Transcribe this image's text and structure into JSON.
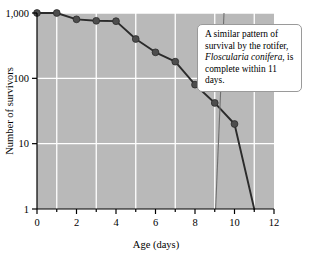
{
  "chart_data": {
    "type": "line",
    "title": "",
    "xlabel": "Age (days)",
    "ylabel": "Number of survivors",
    "yscale": "log",
    "xlim": [
      0,
      12
    ],
    "ylim": [
      1,
      1000
    ],
    "grid": true,
    "grid_color": "#ffffff",
    "plot_bgcolor": "#b9b9b9",
    "line_color": "#2b2b2b",
    "marker_color": "#4d4d4d",
    "legend": "none",
    "xticks": [
      0,
      2,
      4,
      6,
      8,
      10,
      12
    ],
    "xtick_labels": [
      "0",
      "2",
      "4",
      "6",
      "8",
      "10",
      "12"
    ],
    "xminor_ticks": [
      1,
      3,
      5,
      7,
      9,
      11
    ],
    "yticks": [
      1,
      10,
      100,
      1000
    ],
    "ytick_labels": [
      "1",
      "10",
      "100",
      "1,000"
    ],
    "series": [
      {
        "name": "survivors",
        "x": [
          0,
          1,
          2,
          3,
          4,
          5,
          6,
          7,
          8,
          9,
          10,
          11
        ],
        "values": [
          1000,
          1000,
          800,
          760,
          750,
          400,
          250,
          180,
          80,
          42,
          20,
          1
        ],
        "markers_through_x": 10
      }
    ],
    "annotations": [
      {
        "name": "rotifer-note",
        "text_plain": "A similar pattern of survival by the rotifer, Floscularia conifera, is complete within 11 days.",
        "line1": "A similar pattern of",
        "line2": "survival by the rotifer,",
        "line3_italic": "Floscularia conifera",
        "line3_rest": ", is",
        "line4": "complete within 11 days."
      }
    ]
  }
}
